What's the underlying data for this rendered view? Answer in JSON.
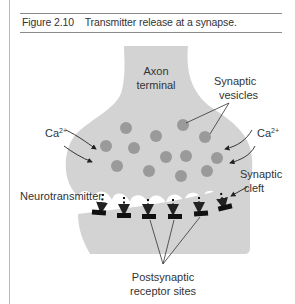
{
  "figure": {
    "number": "Figure 2.10",
    "title": "Transmitter release at a synapse."
  },
  "labels": {
    "axon_line1": "Axon",
    "axon_line2": "terminal",
    "vesicles_line1": "Synaptic",
    "vesicles_line2": "vesicles",
    "ca_left": "Ca",
    "ca_left_sup": "2+",
    "ca_right": "Ca",
    "ca_right_sup": "2+",
    "cleft_line1": "Synaptic",
    "cleft_line2": "cleft",
    "neurotransmitter": "Neurotransmitter",
    "receptor_line1": "Postsynaptic",
    "receptor_line2": "receptor sites"
  },
  "colors": {
    "terminal_fill": "#d3d3d3",
    "vesicle_fill": "#9a9a9a",
    "receptor_fill": "#111111",
    "rule": "#8a8a8a"
  }
}
